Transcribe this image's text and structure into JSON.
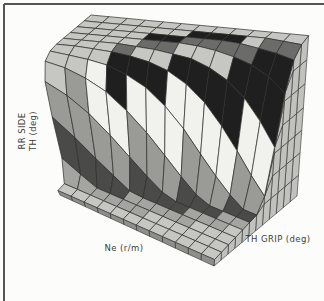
{
  "frame": {
    "color": "#555553"
  },
  "chart_data": {
    "type": "surface",
    "title": "",
    "x_axis": {
      "label": "Ne (r/m)"
    },
    "y_axis": {
      "label": "TH GRIP (deg)"
    },
    "z_axis": {
      "label": "RR SIDE TH (deg)",
      "label_line1": "RR SIDE",
      "label_line2": "TH (deg)"
    },
    "tick_labels_visible": false,
    "note": "scanned 3D throttle-map mesh; no numeric ticks shown, z normalized 0-1 estimated from contour shading bands",
    "grid": {
      "rows_ne": 13,
      "cols_grip": 13
    },
    "z_grid": [
      [
        0.04,
        0.05,
        0.23,
        0.55,
        0.82,
        0.95,
        0.99,
        1,
        1,
        1,
        1,
        1,
        1
      ],
      [
        0.04,
        0.05,
        0.13,
        0.4,
        0.72,
        0.91,
        0.97,
        1,
        1,
        1,
        1,
        1,
        1
      ],
      [
        0.04,
        0.05,
        0.06,
        0.26,
        0.59,
        0.84,
        0.95,
        0.99,
        1,
        1,
        1,
        1,
        1
      ],
      [
        0.04,
        0.05,
        0.06,
        0.16,
        0.44,
        0.75,
        0.92,
        0.98,
        1,
        1,
        1,
        1,
        1
      ],
      [
        0.04,
        0.05,
        0.06,
        0.08,
        0.3,
        0.62,
        0.86,
        0.96,
        0.99,
        1,
        1,
        1,
        1
      ],
      [
        0.04,
        0.05,
        0.06,
        0.07,
        0.19,
        0.48,
        0.78,
        0.93,
        0.98,
        1,
        1,
        1,
        1
      ],
      [
        0.04,
        0.05,
        0.06,
        0.07,
        0.11,
        0.34,
        0.66,
        0.88,
        0.96,
        1,
        1,
        1,
        1
      ],
      [
        0.04,
        0.05,
        0.06,
        0.07,
        0.08,
        0.22,
        0.52,
        0.8,
        0.94,
        0.99,
        1,
        1,
        1
      ],
      [
        0.04,
        0.05,
        0.06,
        0.07,
        0.08,
        0.13,
        0.37,
        0.69,
        0.89,
        0.97,
        1,
        1,
        1
      ],
      [
        0.04,
        0.05,
        0.06,
        0.07,
        0.08,
        0.09,
        0.25,
        0.55,
        0.82,
        0.94,
        0.99,
        1,
        1
      ],
      [
        0.04,
        0.05,
        0.06,
        0.07,
        0.08,
        0.09,
        0.16,
        0.41,
        0.72,
        0.9,
        0.97,
        1,
        1
      ],
      [
        0.04,
        0.05,
        0.06,
        0.07,
        0.08,
        0.09,
        0.1,
        0.28,
        0.59,
        0.84,
        0.95,
        0.99,
        1
      ],
      [
        0.04,
        0.05,
        0.06,
        0.07,
        0.08,
        0.09,
        0.1,
        0.18,
        0.45,
        0.75,
        0.92,
        0.98,
        1
      ]
    ],
    "cell_bands": [
      [
        0,
        6,
        4,
        3,
        0,
        0,
        0,
        0,
        0,
        0,
        0,
        0
      ],
      [
        0,
        6,
        4,
        3,
        3,
        0,
        0,
        0,
        0,
        0,
        0,
        0
      ],
      [
        0,
        6,
        4,
        3,
        2,
        2,
        0,
        0,
        0,
        0,
        0,
        0
      ],
      [
        0,
        6,
        4,
        3,
        2,
        1,
        1,
        5,
        0,
        0,
        0,
        0
      ],
      [
        0,
        6,
        6,
        4,
        3,
        2,
        1,
        0,
        5,
        1,
        0,
        0
      ],
      [
        0,
        6,
        6,
        4,
        3,
        2,
        1,
        0,
        5,
        1,
        0,
        0
      ],
      [
        0,
        0,
        6,
        4,
        3,
        2,
        2,
        1,
        0,
        5,
        1,
        0
      ],
      [
        0,
        0,
        6,
        4,
        4,
        3,
        2,
        1,
        0,
        5,
        1,
        0
      ],
      [
        0,
        0,
        6,
        6,
        4,
        3,
        2,
        1,
        0,
        5,
        1,
        0
      ],
      [
        0,
        0,
        0,
        6,
        4,
        3,
        2,
        1,
        1,
        5,
        0,
        0
      ],
      [
        0,
        0,
        0,
        6,
        6,
        4,
        3,
        2,
        1,
        1,
        5,
        0
      ],
      [
        0,
        0,
        0,
        0,
        6,
        4,
        3,
        2,
        1,
        1,
        5,
        0
      ]
    ],
    "band_palette": [
      "#c6c6c3",
      "#1f1f1f",
      "#f1f1ee",
      "#9a9a97",
      "#4a4a48",
      "#6b6b69",
      "#a4a4a1"
    ],
    "mesh_line_color": "#2d2d2b",
    "curtain_color": "#c1c1be",
    "front_edge_color": "#8e8e8b"
  }
}
